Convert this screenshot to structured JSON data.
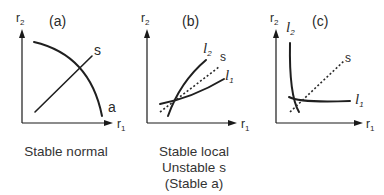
{
  "panels": [
    {
      "id": "a",
      "title": "(a)",
      "y_axis": {
        "label": "r",
        "sub": "2"
      },
      "x_axis": {
        "label": "r",
        "sub": "1"
      },
      "curves": [
        {
          "name": "a",
          "label": "a",
          "style": "solid"
        },
        {
          "name": "s",
          "label": "s",
          "style": "solid"
        }
      ],
      "caption": [
        "Stable normal"
      ]
    },
    {
      "id": "b",
      "title": "(b)",
      "y_axis": {
        "label": "r",
        "sub": "2"
      },
      "x_axis": {
        "label": "r",
        "sub": "1"
      },
      "curves": [
        {
          "name": "l2",
          "label": "l",
          "sub": "2",
          "style": "solid"
        },
        {
          "name": "s",
          "label": "s",
          "style": "dotted"
        },
        {
          "name": "l1",
          "label": "l",
          "sub": "1",
          "style": "solid"
        }
      ],
      "caption": [
        "Stable local",
        "Unstable s",
        "(Stable a)"
      ]
    },
    {
      "id": "c",
      "title": "(c)",
      "y_axis": {
        "label": "r",
        "sub": "2"
      },
      "x_axis": {
        "label": "r",
        "sub": "1"
      },
      "curves": [
        {
          "name": "l2",
          "label": "l",
          "sub": "2",
          "style": "solid"
        },
        {
          "name": "s",
          "label": "s",
          "style": "dotted"
        },
        {
          "name": "l1",
          "label": "l",
          "sub": "1",
          "style": "solid"
        }
      ],
      "caption": []
    }
  ],
  "colors": {
    "ink": "#1f1f1f",
    "background": "#ffffff"
  }
}
